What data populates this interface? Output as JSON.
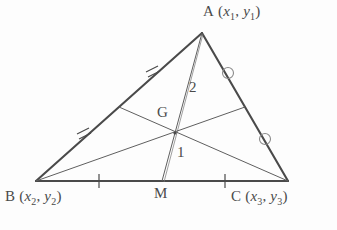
{
  "figure": {
    "background_color": "#fdfdfd",
    "stroke_color": "#4a4a4a",
    "thin_stroke_color": "#6a6a6a"
  },
  "vertices": {
    "A": {
      "label_text": "A",
      "coord_text": "(x1, y1)",
      "x_var": "x",
      "x_sub": "1",
      "y_var": "y",
      "y_sub": "1",
      "px": 202,
      "py": 33,
      "label_px": 206,
      "label_py": 4
    },
    "B": {
      "label_text": "B",
      "coord_text": "(x2, y2)",
      "x_var": "x",
      "x_sub": "2",
      "y_var": "y",
      "y_sub": "2",
      "px": 36,
      "py": 181,
      "label_px": 6,
      "label_py": 189
    },
    "C": {
      "label_text": "C",
      "coord_text": "(x3, y3)",
      "x_var": "x",
      "x_sub": "3",
      "y_var": "y",
      "y_sub": "3",
      "px": 288,
      "py": 181,
      "label_px": 231,
      "label_py": 189
    }
  },
  "points": {
    "G": {
      "label": "G",
      "px": 175,
      "py": 133,
      "label_px": 158,
      "label_py": 106
    },
    "M": {
      "label": "M",
      "px": 162,
      "py": 181,
      "label_px": 155,
      "label_py": 186
    },
    "midpoint_AB": {
      "px": 119,
      "py": 107
    },
    "midpoint_AC": {
      "px": 245,
      "py": 107
    }
  },
  "ratio_labels": [
    {
      "text": "2",
      "px": 190,
      "py": 80,
      "describes": "AG"
    },
    {
      "text": "1",
      "px": 178,
      "py": 145,
      "describes": "GM"
    }
  ],
  "tick_marks": {
    "side_AB": {
      "style": "double-hash",
      "count": 2,
      "positions": [
        {
          "px": 152,
          "py": 71
        },
        {
          "px": 83,
          "py": 133
        }
      ]
    },
    "side_AC": {
      "style": "circle",
      "count": 2,
      "positions": [
        {
          "px": 228,
          "py": 73
        },
        {
          "px": 265,
          "py": 139
        }
      ]
    },
    "side_BC": {
      "style": "single-tick",
      "count": 2,
      "positions": [
        {
          "px": 99,
          "py": 181
        },
        {
          "px": 225,
          "py": 181
        }
      ]
    }
  }
}
